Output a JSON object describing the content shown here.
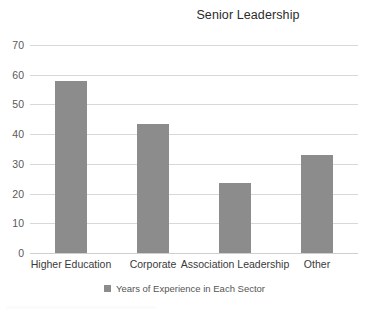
{
  "chart_data": {
    "type": "bar",
    "title": "Senior Leadership",
    "xlabel": "",
    "ylabel": "",
    "categories": [
      "Higher Education",
      "Corporate",
      "Association Leadership",
      "Other"
    ],
    "values": [
      58,
      43.5,
      23.5,
      33
    ],
    "series": [
      {
        "name": "Years of Experience in Each Sector",
        "values": [
          58,
          43.5,
          23.5,
          33
        ]
      }
    ],
    "ylim": [
      0,
      70
    ],
    "yticks": [
      0,
      10,
      20,
      30,
      40,
      50,
      60,
      70
    ],
    "ytick_labels": [
      "0",
      "10",
      "20",
      "30",
      "40",
      "50",
      "60",
      "70"
    ],
    "grid": true,
    "legend": {
      "position": "bottom-center",
      "entries": [
        {
          "label": "Years of Experience in Each Sector",
          "color": "#8c8c8c"
        }
      ]
    },
    "bar_color": "#8c8c8c",
    "gridline_color": "#d8d8d8",
    "background": "#ffffff"
  }
}
